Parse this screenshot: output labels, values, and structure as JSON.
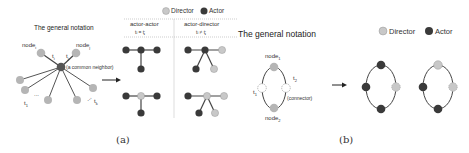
{
  "panel_a": {
    "notation_title": "The general notation",
    "node_i_label": "node",
    "node_i_sub": "i",
    "node_j_label": "node",
    "node_j_sub": "j",
    "t_i": "t",
    "t_i_sub": "i",
    "t_j": "t",
    "t_j_sub": "j",
    "common_neighbor": "(a common neighbor)",
    "t_1": "t",
    "t_1_sub": "1",
    "t_k": "t",
    "t_k_sub": "k",
    "ellipsis": "...",
    "legend": {
      "director": "Director",
      "actor": "Actor"
    },
    "columns": [
      {
        "header": "actor-actor",
        "condition": "tᵢ = tⱼ"
      },
      {
        "header": "actor-director",
        "condition": "tᵢ ≠ tⱼ"
      }
    ],
    "caption": "(a)"
  },
  "panel_b": {
    "notation_title": "The general notation",
    "node_1_label": "node",
    "node_1_sub": "1",
    "node_2_label": "node",
    "node_2_sub": "2",
    "t_1": "t",
    "t_1_sub": "1",
    "t_2": "t",
    "t_2_sub": "2",
    "connector": "(connector)",
    "legend": {
      "director": "Director",
      "actor": "Actor"
    },
    "caption": "(b)"
  },
  "colors": {
    "director": "#c8c8c8",
    "actor": "#3a3a3a",
    "generic_node": "#b5b5b5",
    "edge": "#555555"
  }
}
